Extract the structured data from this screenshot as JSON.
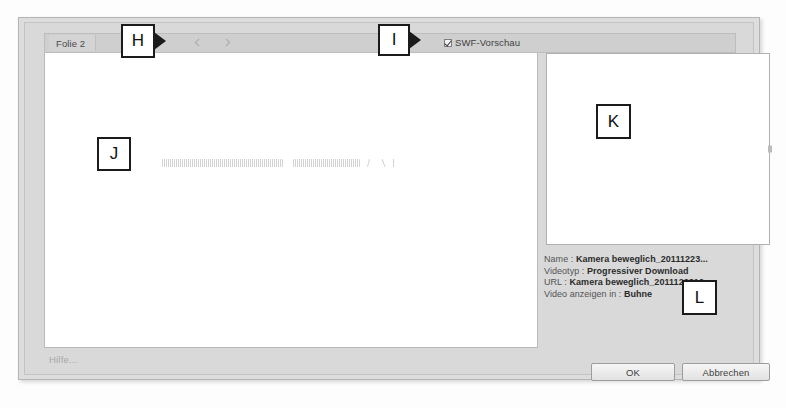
{
  "dialog": {
    "tab_label": "Folie 2",
    "nav_prev_icon": "chevron-left-icon",
    "nav_next_icon": "chevron-right-icon",
    "swf_preview_label": "SWF-Vorschau",
    "swf_preview_checked": "true",
    "help_label": "Hilfe...",
    "ok_label": "OK",
    "cancel_label": "Abbrechen"
  },
  "info": {
    "name_key": "Name :",
    "name_value": "Kamera beweglich_20111223...",
    "videotype_key": "Videotyp :",
    "videotype_value": "Progressiver Download",
    "url_key": "URL :",
    "url_value": "Kamera beweglich_2011122310...",
    "display_key": "Video anzeigen in :",
    "display_value": "Buhne"
  },
  "callouts": {
    "h": "H",
    "i": "I",
    "j": "J",
    "k": "K",
    "l": "L"
  },
  "colors": {
    "dialog_bg": "#d9d9d9",
    "canvas_bg": "#ffffff",
    "callout_border": "#1b1b1b",
    "text": "#3d3d3d"
  }
}
